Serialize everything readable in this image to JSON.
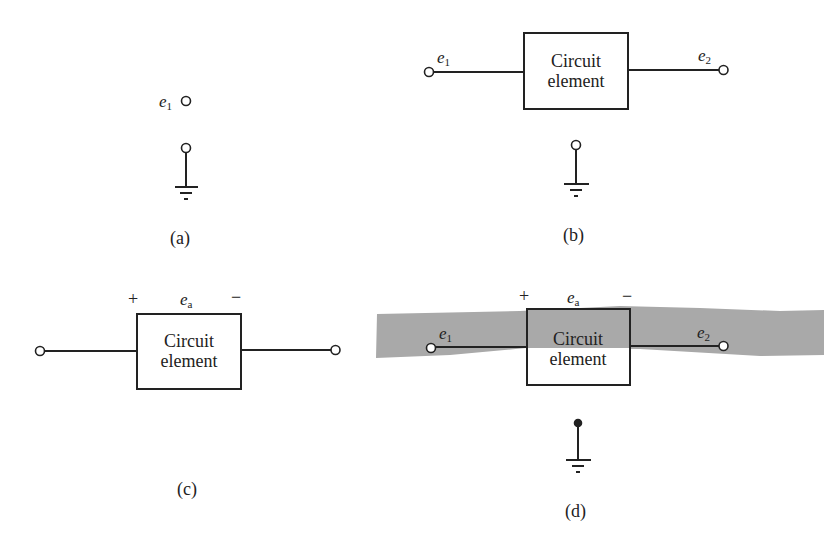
{
  "figure": {
    "panels": [
      {
        "id": "a",
        "caption": "(a)",
        "node_label": "e",
        "node_sub": "1",
        "has_ground": true,
        "ground_terminal": "open"
      },
      {
        "id": "b",
        "caption": "(b)",
        "box_line1": "Circuit",
        "box_line2": "element",
        "left_label": "e",
        "left_sub": "1",
        "right_label": "e",
        "right_sub": "2",
        "has_ground": true,
        "ground_terminal": "open"
      },
      {
        "id": "c",
        "caption": "(c)",
        "box_line1": "Circuit",
        "box_line2": "element",
        "plus": "+",
        "minus": "−",
        "voltage_label": "e",
        "voltage_sub": "a"
      },
      {
        "id": "d",
        "caption": "(d)",
        "box_line1": "Circuit",
        "box_line2": "element",
        "plus": "+",
        "minus": "−",
        "voltage_label": "e",
        "voltage_sub": "a",
        "left_label": "e",
        "left_sub": "1",
        "right_label": "e",
        "right_sub": "2",
        "has_ground": true,
        "ground_terminal": "filled",
        "highlight_band_color": "#a9a9a9"
      }
    ]
  }
}
